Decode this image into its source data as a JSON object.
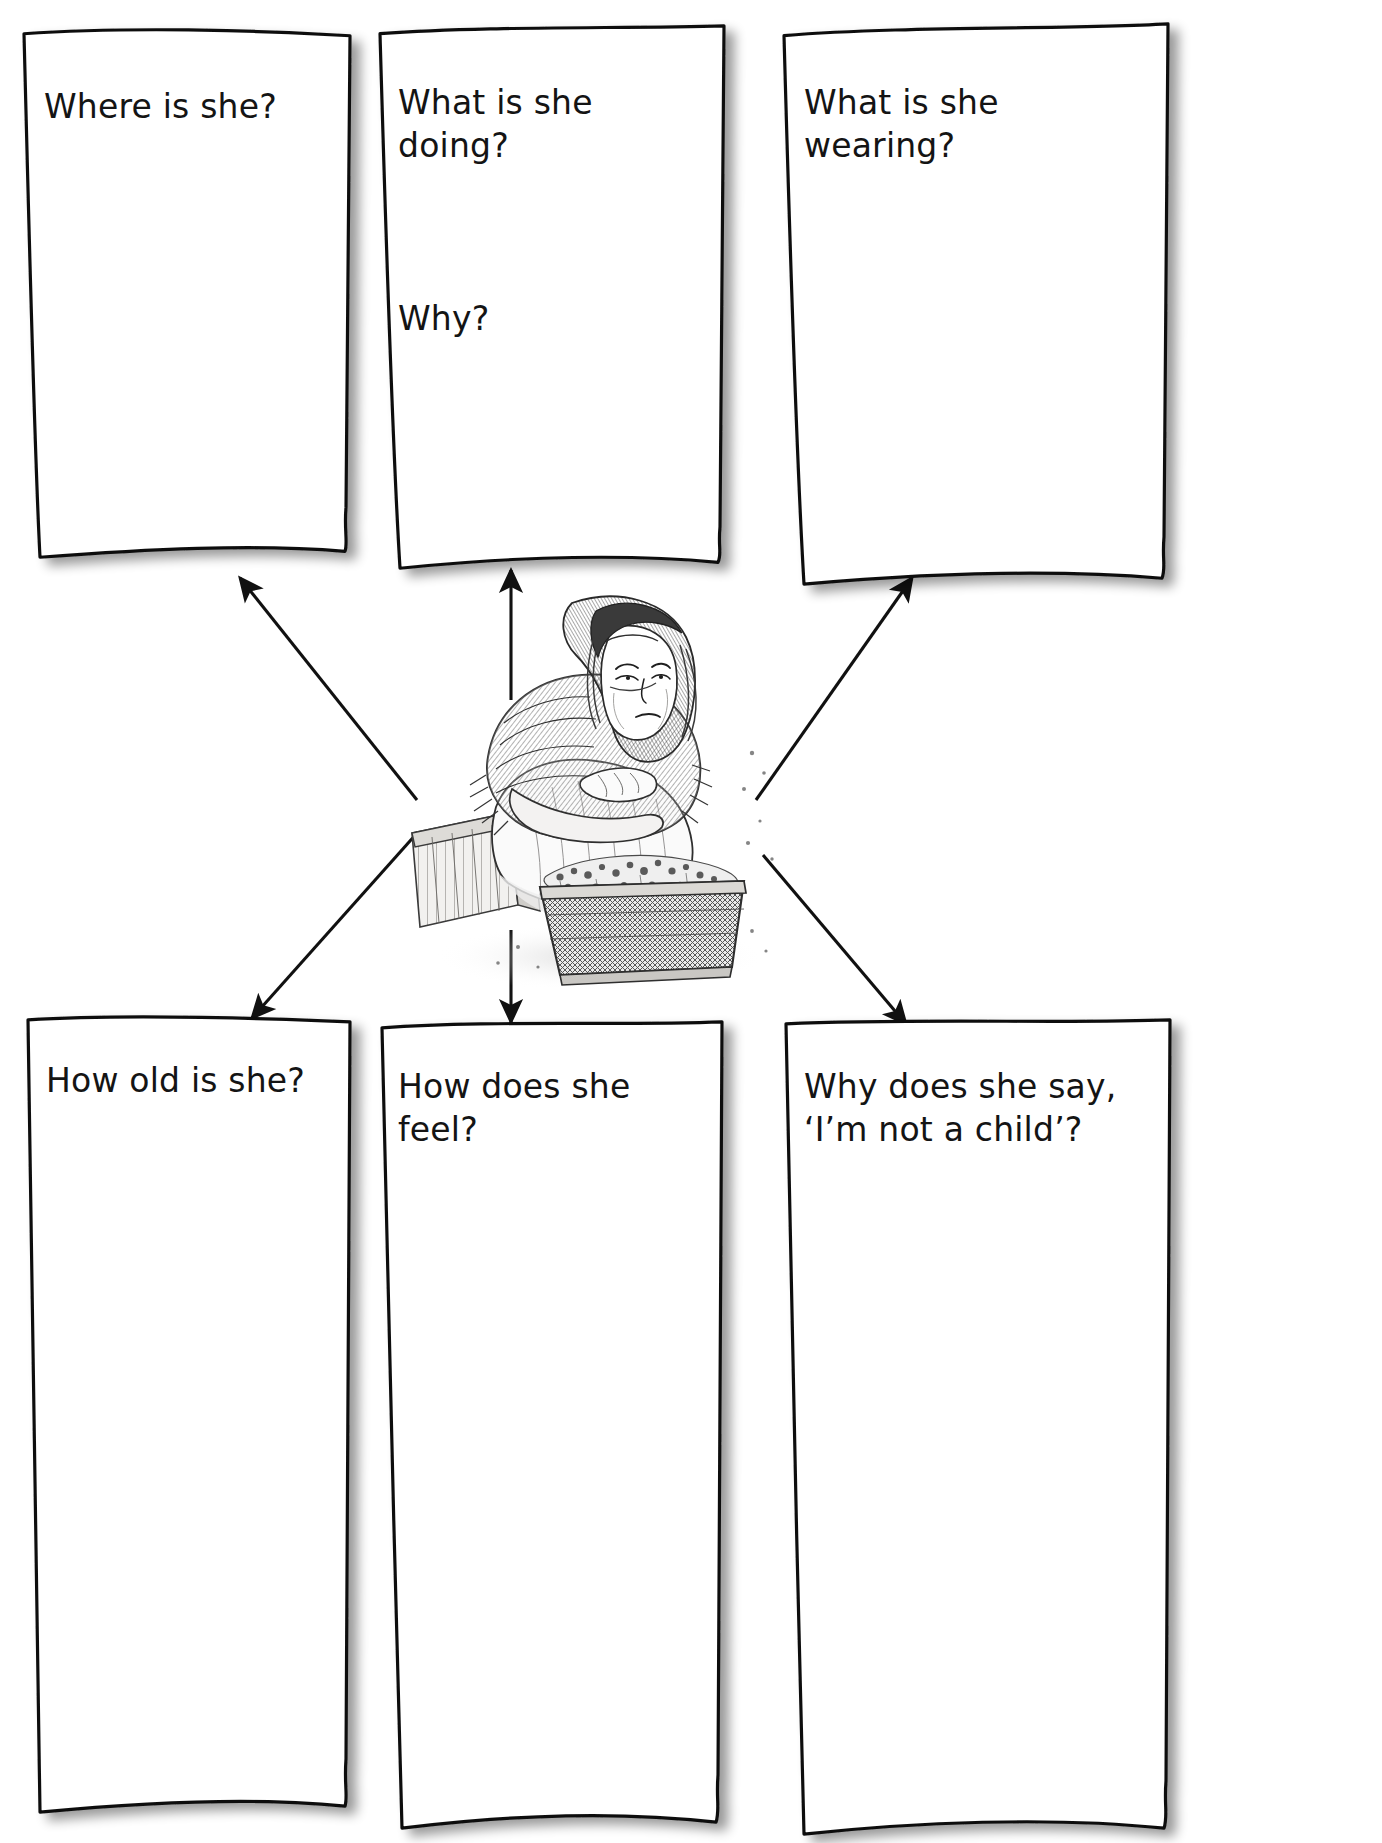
{
  "worksheet": {
    "type": "question-web-worksheet",
    "layout": "six question boxes surrounding a central illustration, each linked by an arrow",
    "background_color": "#ffffff",
    "ink_color": "#141414"
  },
  "cards": {
    "top_left": {
      "name": "where-is-she",
      "lines": [
        "Where is she?"
      ]
    },
    "top_middle": {
      "name": "what-is-she-doing",
      "lines": [
        "What is she doing?"
      ],
      "secondary": "Why?"
    },
    "top_right": {
      "name": "what-is-she-wearing",
      "lines": [
        "What is she wearing?"
      ]
    },
    "bottom_left": {
      "name": "how-old-is-she",
      "lines": [
        "How old is she?"
      ]
    },
    "bottom_middle": {
      "name": "how-does-she-feel",
      "lines": [
        "How does she feel?"
      ]
    },
    "bottom_right": {
      "name": "why-does-she-say",
      "line1": "Why does she say,",
      "line2": "‘I’m not a child’?"
    }
  },
  "illustration": {
    "name": "girl-selling-flowers-sketch",
    "description": "Pencil sketch of a young girl in a shawl sitting on a wooden crate beside a basket of flowers",
    "alt": "girl-on-crate-with-flower-basket"
  },
  "arrows": {
    "count": 6,
    "style": "thin solid line with solid triangular arrowhead",
    "targets": [
      "where-is-she",
      "what-is-she-doing",
      "what-is-she-wearing",
      "how-old-is-she",
      "how-does-she-feel",
      "why-does-she-say"
    ]
  }
}
